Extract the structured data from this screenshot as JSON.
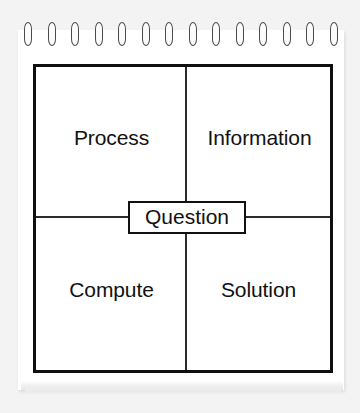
{
  "diagram": {
    "medium": "spiral-bound notepad page",
    "spiral": {
      "ring_count": 14,
      "icon": "spiral-ring-icon",
      "color": "#4a4a4a"
    },
    "colors": {
      "background": "#f3f3f3",
      "page": "#ffffff",
      "frame_border": "#0f0f0f",
      "divider": "#2b2b2b",
      "text": "#111111"
    },
    "center": {
      "label": "Question"
    },
    "quadrants": [
      {
        "position": "top-left",
        "label": "Process"
      },
      {
        "position": "top-right",
        "label": "Information"
      },
      {
        "position": "bottom-left",
        "label": "Compute"
      },
      {
        "position": "bottom-right",
        "label": "Solution"
      }
    ]
  }
}
